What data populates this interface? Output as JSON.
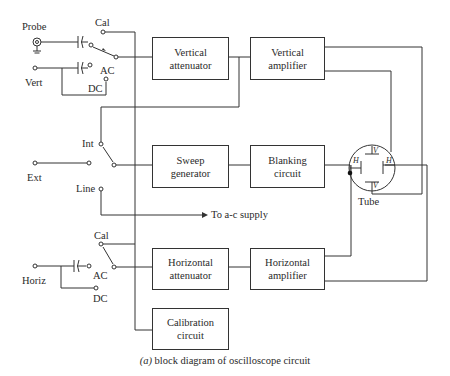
{
  "figure": {
    "caption_prefix": "(a)",
    "caption": "block diagram of oscilloscope circuit"
  },
  "inputs": {
    "probe": "Probe",
    "vert": "Vert",
    "ext": "Ext",
    "horiz": "Horiz"
  },
  "switch_labels": {
    "vert_cal": "Cal",
    "vert_ac": "AC",
    "vert_dc": "DC",
    "int": "Int",
    "line": "Line",
    "horiz_cal": "Cal",
    "horiz_ac": "AC",
    "horiz_dc": "DC"
  },
  "blocks": {
    "vertical_attenuator": [
      "Vertical",
      "attenuator"
    ],
    "vertical_amplifier": [
      "Vertical",
      "amplifier"
    ],
    "sweep_generator": [
      "Sweep",
      "generator"
    ],
    "blanking_circuit": [
      "Blanking",
      "circuit"
    ],
    "horizontal_attenuator": [
      "Horizontal",
      "attenuator"
    ],
    "horizontal_amplifier": [
      "Horizontal",
      "amplifier"
    ],
    "calibration_circuit": [
      "Calibration",
      "circuit"
    ]
  },
  "tube": {
    "label": "Tube",
    "plate_v": "V",
    "plate_h": "H"
  },
  "supply": {
    "label": "To a-c supply"
  }
}
